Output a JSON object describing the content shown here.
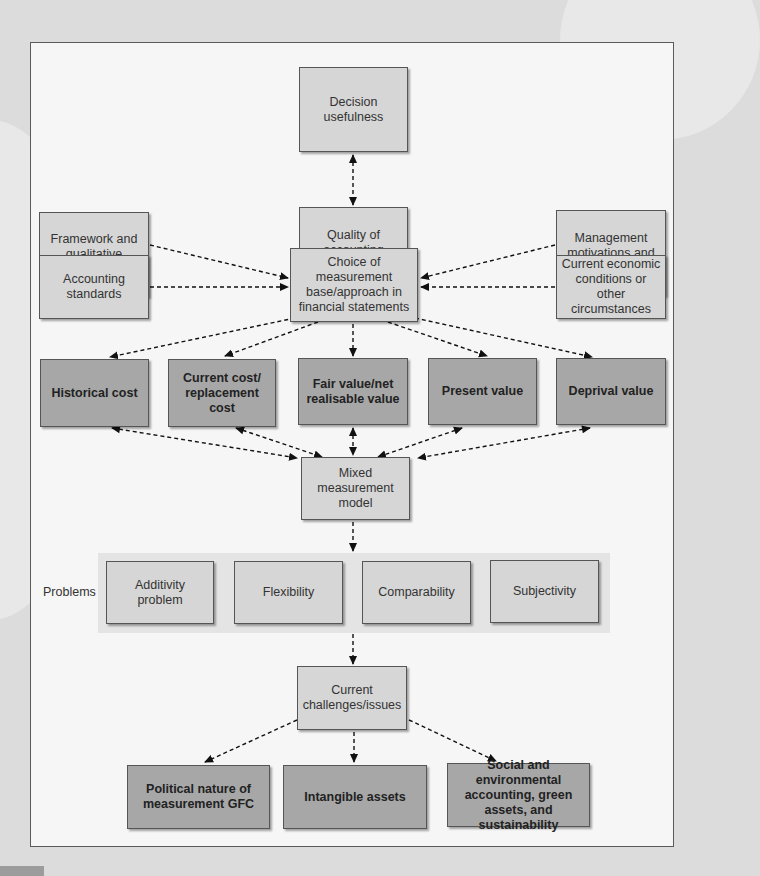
{
  "diagram": {
    "top": {
      "decision": "Decision usefulness",
      "quality": "Quality of accounting information"
    },
    "influences": {
      "framework": "Framework and qualitative characteristics",
      "standards": "Accounting standards",
      "management": "Management motivations and objectives",
      "economic": "Current economic conditions or other circumstances"
    },
    "choice": "Choice of measurement base/approach in financial statements",
    "bases": [
      "Historical cost",
      "Current cost/ replacement cost",
      "Fair value/net realisable value",
      "Present value",
      "Deprival value"
    ],
    "mixed": "Mixed measurement model",
    "problems": {
      "label": "Problems",
      "items": [
        "Additivity problem",
        "Flexibility",
        "Comparability",
        "Subjectivity"
      ]
    },
    "challenges": "Current challenges/issues",
    "issues": [
      "Political nature of measurement GFC",
      "Intangible assets",
      "Social and environmental accounting, green assets, and sustainability"
    ]
  },
  "colors": {
    "light_box": "#d6d6d6",
    "dark_box": "#a7a7a7",
    "frame_bg": "#f6f6f6",
    "page_bg": "#dcdcdc"
  }
}
